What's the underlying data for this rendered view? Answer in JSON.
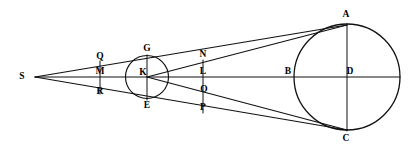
{
  "figure": {
    "background_color": "#ffffff",
    "stroke_color": "#111111",
    "width": 418,
    "height": 159,
    "labels": {
      "S": "S",
      "Q": "Q",
      "M": "M",
      "R": "R",
      "G": "G",
      "K": "K",
      "E": "E",
      "N": "N",
      "L": "L",
      "O": "O",
      "P": "P",
      "A": "A",
      "B": "B",
      "D": "D",
      "C": "C"
    },
    "points": [
      {
        "id": "S",
        "label": "S",
        "x": 35,
        "y": 77,
        "label_x": 22,
        "label_y": 77
      },
      {
        "id": "Q",
        "label": "Q",
        "x": 100,
        "y": 62,
        "label_x": 100,
        "label_y": 57
      },
      {
        "id": "M",
        "label": "M",
        "x": 100,
        "y": 77,
        "label_x": 100,
        "label_y": 72
      },
      {
        "id": "R",
        "label": "R",
        "x": 100,
        "y": 93,
        "label_x": 100,
        "label_y": 92
      },
      {
        "id": "G",
        "label": "G",
        "x": 147,
        "y": 56,
        "label_x": 147,
        "label_y": 49
      },
      {
        "id": "K",
        "label": "K",
        "x": 147,
        "y": 77,
        "label_x": 143,
        "label_y": 73
      },
      {
        "id": "E",
        "label": "E",
        "x": 147,
        "y": 99,
        "label_x": 147,
        "label_y": 106
      },
      {
        "id": "N",
        "label": "N",
        "x": 203,
        "y": 61,
        "label_x": 203,
        "label_y": 55
      },
      {
        "id": "L",
        "label": "L",
        "x": 203,
        "y": 77,
        "label_x": 203,
        "label_y": 72
      },
      {
        "id": "O",
        "label": "O",
        "x": 203,
        "y": 95,
        "label_x": 204,
        "label_y": 90
      },
      {
        "id": "P",
        "label": "P",
        "x": 203,
        "y": 112,
        "label_x": 203,
        "label_y": 108
      },
      {
        "id": "A",
        "label": "A",
        "x": 347,
        "y": 25,
        "label_x": 346,
        "label_y": 15
      },
      {
        "id": "B",
        "label": "B",
        "x": 294,
        "y": 77,
        "label_x": 288,
        "label_y": 72
      },
      {
        "id": "D",
        "label": "D",
        "x": 347,
        "y": 77,
        "label_x": 350,
        "label_y": 72
      },
      {
        "id": "C",
        "label": "C",
        "x": 347,
        "y": 130,
        "label_x": 346,
        "label_y": 139
      }
    ],
    "circles": [
      {
        "id": "small-circle",
        "center": "K",
        "cx": 147,
        "cy": 77,
        "r": 21.5
      },
      {
        "id": "large-circle",
        "center": "D",
        "cx": 347,
        "cy": 77,
        "r": 53
      }
    ],
    "segments": [
      {
        "id": "axis-SD",
        "from": "S",
        "to": "D-right"
      },
      {
        "id": "ray-S-Q-A",
        "from": "S",
        "to": "A"
      },
      {
        "id": "ray-S-R-C",
        "from": "S",
        "to": "C"
      },
      {
        "id": "ray-K-N-A",
        "from": "K",
        "to": "A"
      },
      {
        "id": "ray-K-O-C",
        "from": "K",
        "to": "C"
      },
      {
        "id": "chord-QMR",
        "from": "Q",
        "to": "R"
      },
      {
        "id": "chord-NLOP",
        "from": "N",
        "to": "P"
      },
      {
        "id": "diameter-GE",
        "from": "G",
        "to": "E"
      },
      {
        "id": "diameter-AC",
        "from": "A",
        "to": "C"
      }
    ]
  }
}
